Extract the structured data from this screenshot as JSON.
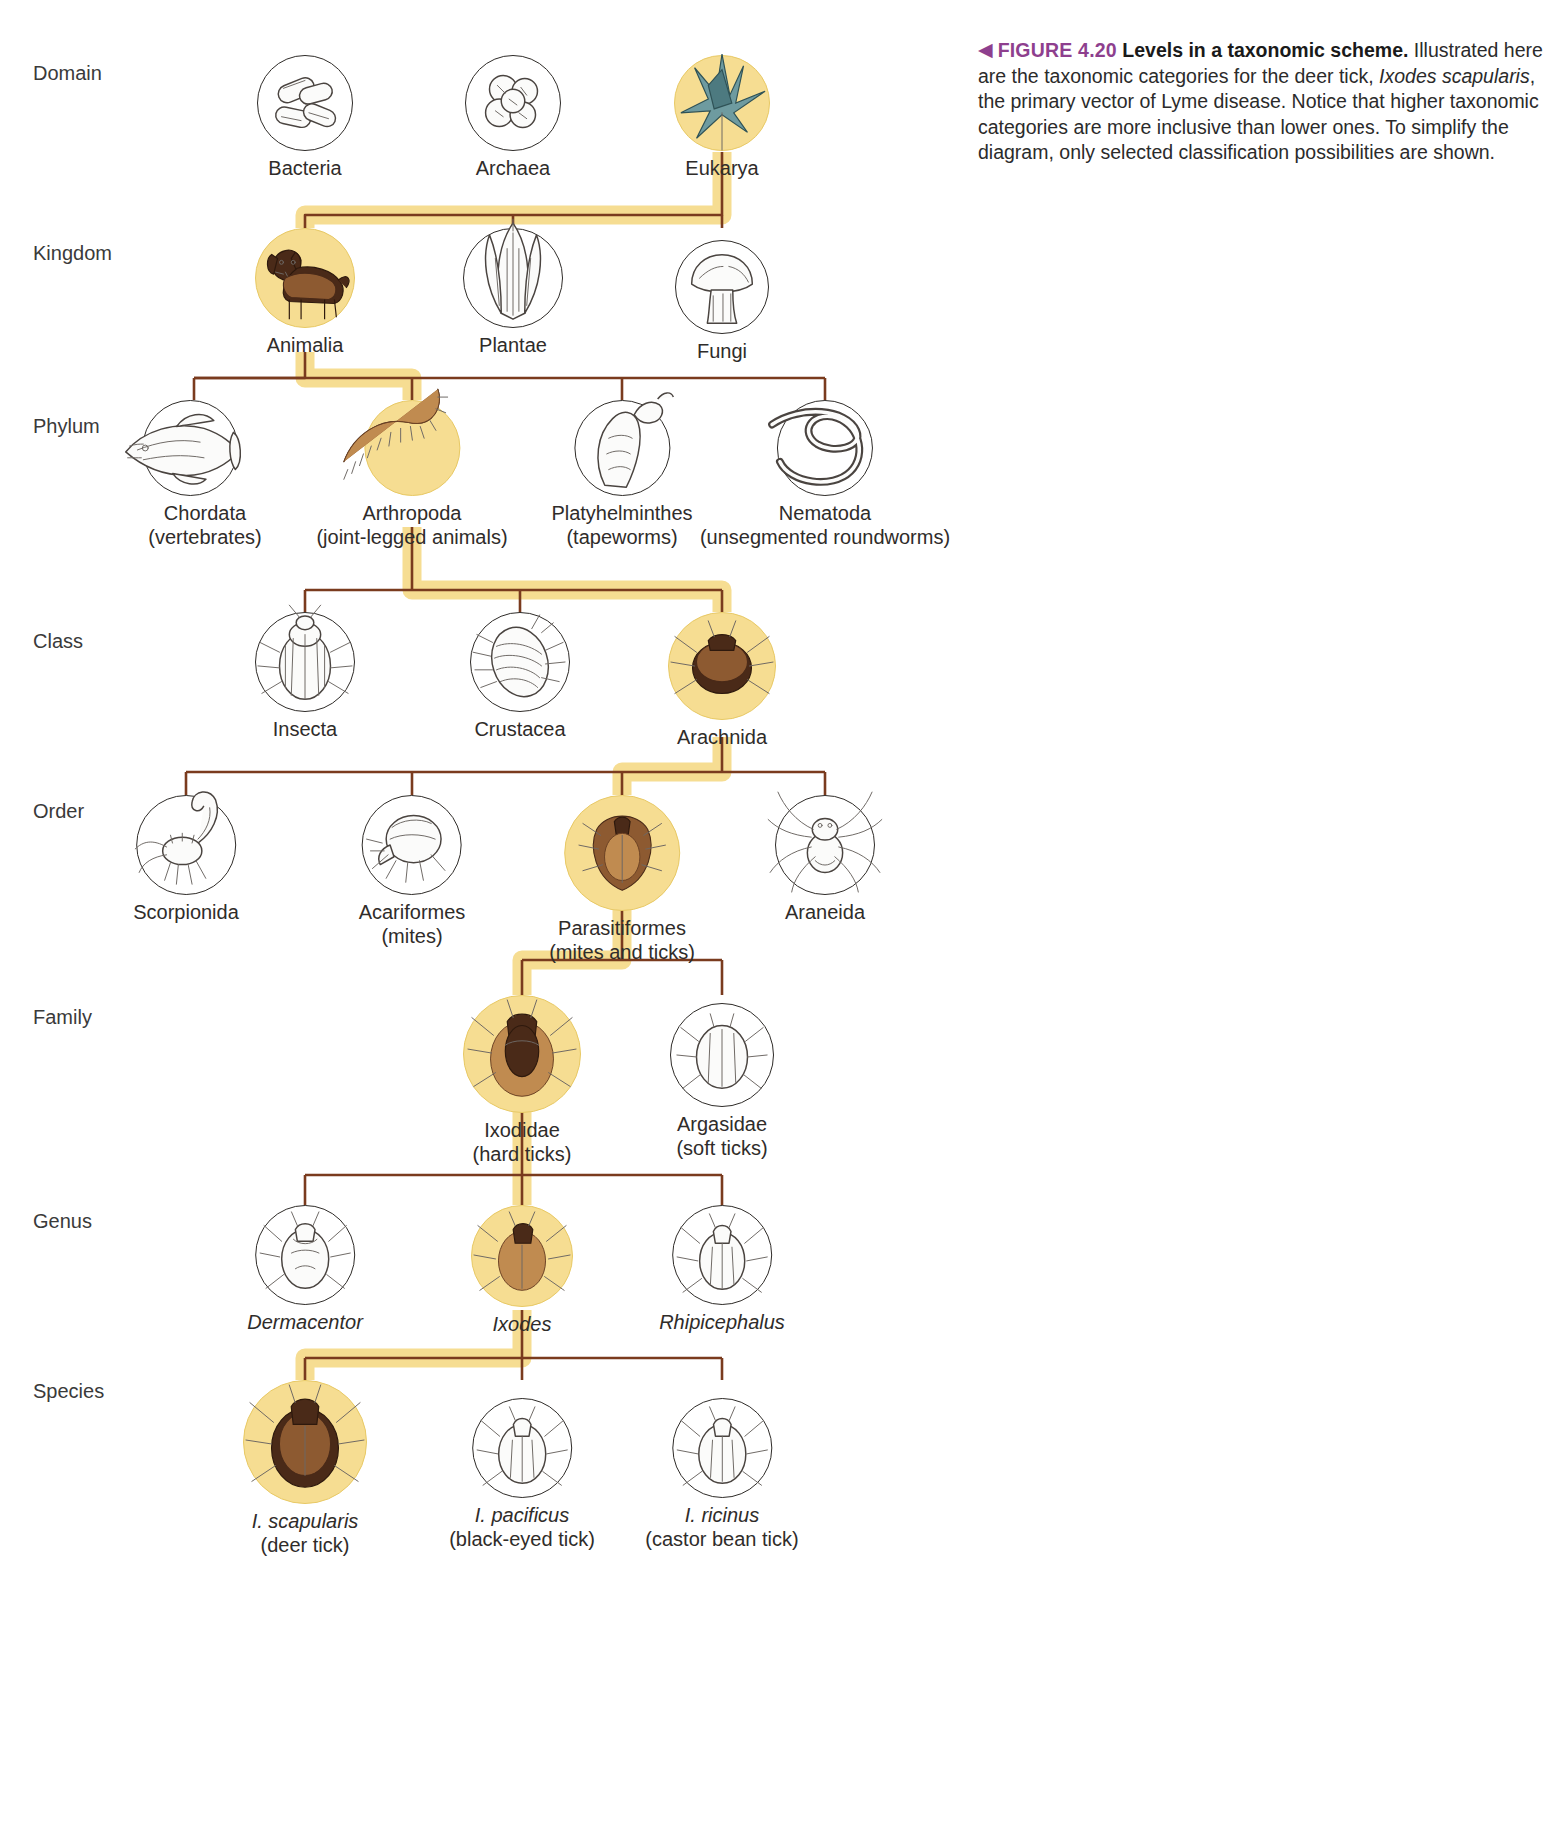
{
  "caption": {
    "marker": "◀",
    "figure_number": "FIGURE 4.20",
    "title": "Levels in a taxonomic scheme.",
    "body_part1": "Illustrated here are the taxonomic categories for the deer tick, ",
    "species_italic": "Ixodes scapularis",
    "body_part2": ", the primary vector of Lyme disease. Notice that higher taxonomic categories are more inclusive than lower ones. To simplify the diagram, only selected classification possibilities are shown."
  },
  "ranks": [
    {
      "label": "Domain"
    },
    {
      "label": "Kingdom"
    },
    {
      "label": "Phylum"
    },
    {
      "label": "Class"
    },
    {
      "label": "Order"
    },
    {
      "label": "Family"
    },
    {
      "label": "Genus"
    },
    {
      "label": "Species"
    }
  ],
  "colors": {
    "highlight_band": "#f6dd92",
    "highlight_disc": "#f6dd92",
    "connector_line": "#7a3b1e",
    "caption_accent": "#8e3f8e",
    "text": "#2f2c2a"
  },
  "nodes": {
    "domain": [
      {
        "name": "Bacteria",
        "sub": "",
        "highlighted": false,
        "icon": "bacilli-icon"
      },
      {
        "name": "Archaea",
        "sub": "",
        "highlighted": false,
        "icon": "archaea-cluster-icon"
      },
      {
        "name": "Eukarya",
        "sub": "",
        "highlighted": true,
        "icon": "protist-flagellate-icon"
      }
    ],
    "kingdom": [
      {
        "name": "Animalia",
        "sub": "",
        "highlighted": true,
        "icon": "dog-icon"
      },
      {
        "name": "Plantae",
        "sub": "",
        "highlighted": false,
        "icon": "corn-plant-icon"
      },
      {
        "name": "Fungi",
        "sub": "",
        "highlighted": false,
        "icon": "mushroom-icon"
      }
    ],
    "phylum": [
      {
        "name": "Chordata",
        "sub": "(vertebrates)",
        "highlighted": false,
        "icon": "fish-icon"
      },
      {
        "name": "Arthropoda",
        "sub": "(joint-legged animals)",
        "highlighted": true,
        "icon": "centipede-icon"
      },
      {
        "name": "Platyhelminthes",
        "sub": "(tapeworms)",
        "highlighted": false,
        "icon": "tapeworm-icon"
      },
      {
        "name": "Nematoda",
        "sub": "(unsegmented roundworms)",
        "highlighted": false,
        "icon": "roundworm-icon"
      }
    ],
    "class": [
      {
        "name": "Insecta",
        "sub": "",
        "highlighted": false,
        "icon": "beetle-icon"
      },
      {
        "name": "Crustacea",
        "sub": "",
        "highlighted": false,
        "icon": "isopod-icon"
      },
      {
        "name": "Arachnida",
        "sub": "",
        "highlighted": true,
        "icon": "tick-dorsal-icon"
      }
    ],
    "order": [
      {
        "name": "Scorpionida",
        "sub": "",
        "highlighted": false,
        "icon": "scorpion-icon"
      },
      {
        "name": "Acariformes",
        "sub": "(mites)",
        "highlighted": false,
        "icon": "mite-icon"
      },
      {
        "name": "Parasitiformes",
        "sub": "(mites and ticks)",
        "highlighted": true,
        "icon": "tick-ventral-icon"
      },
      {
        "name": "Araneida",
        "sub": "",
        "highlighted": false,
        "icon": "spider-icon"
      }
    ],
    "family": [
      {
        "name": "Ixodidae",
        "sub": "(hard ticks)",
        "highlighted": true,
        "icon": "hard-tick-icon"
      },
      {
        "name": "Argasidae",
        "sub": "(soft ticks)",
        "highlighted": false,
        "icon": "soft-tick-icon"
      }
    ],
    "genus": [
      {
        "name": "Dermacentor",
        "sub": "",
        "highlighted": false,
        "italic": true,
        "icon": "dermacentor-icon"
      },
      {
        "name": "Ixodes",
        "sub": "",
        "highlighted": true,
        "italic": true,
        "icon": "ixodes-icon"
      },
      {
        "name": "Rhipicephalus",
        "sub": "",
        "highlighted": false,
        "italic": true,
        "icon": "rhipicephalus-icon"
      }
    ],
    "species": [
      {
        "name": "I. scapularis",
        "sub": "(deer tick)",
        "highlighted": true,
        "italic": true,
        "icon": "deer-tick-icon"
      },
      {
        "name": "I. pacificus",
        "sub": "(black-eyed tick)",
        "highlighted": false,
        "italic": true,
        "icon": "black-eyed-tick-icon"
      },
      {
        "name": "I. ricinus",
        "sub": "(castor bean tick)",
        "highlighted": false,
        "italic": true,
        "icon": "castor-bean-tick-icon"
      }
    ]
  }
}
